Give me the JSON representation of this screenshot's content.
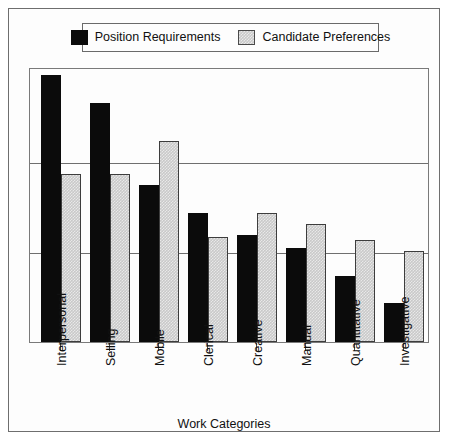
{
  "chart_data": {
    "type": "bar",
    "title": "",
    "xlabel": "Work Categories",
    "ylabel": "",
    "ylim": [
      0,
      100
    ],
    "grid": true,
    "gridlines": [
      33,
      66
    ],
    "legend_position": "top",
    "categories": [
      "Interpersonal",
      "Selling",
      "Mobile",
      "Clerical",
      "Creative",
      "Manual",
      "Quantitative",
      "Investigative"
    ],
    "series": [
      {
        "name": "Position Requirements",
        "color": "#0b0b0b",
        "values": [
          97,
          87,
          57,
          47,
          39,
          34,
          24,
          14
        ]
      },
      {
        "name": "Candidate Preferences",
        "color": "#c9c9c9",
        "values": [
          61,
          61,
          73,
          38,
          47,
          43,
          37,
          33
        ]
      }
    ]
  },
  "legend": {
    "entries": [
      {
        "label": "Position Requirements",
        "swatch": "black-swatch-icon"
      },
      {
        "label": "Candidate Preferences",
        "swatch": "gray-swatch-icon"
      }
    ]
  },
  "axis": {
    "x_title": "Work Categories"
  },
  "colors": {
    "series_black": "#0b0b0b",
    "series_gray": "#c9c9c9",
    "frame": "#6e6e6e",
    "gridline": "#6f6f6f",
    "background": "#fdfdfd"
  }
}
